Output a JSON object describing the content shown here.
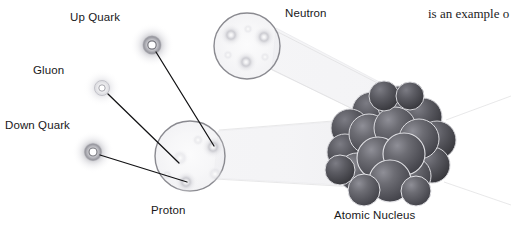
{
  "figure": {
    "kind": "scientific-illustration",
    "background_color": "#ffffff",
    "label_color": "#18181a",
    "leader_line_color": "#121214",
    "cone_color": "#e2e2e4",
    "nucleus_sphere_color": "#5d5d63",
    "labels": {
      "up_quark": "Up Quark",
      "gluon": "Gluon",
      "down_quark": "Down Quark",
      "proton": "Proton",
      "neutron": "Neutron",
      "atomic_nucleus": "Atomic Nucleus"
    },
    "body_text": "is an example o",
    "structures": {
      "proton": {
        "name": "Proton",
        "center_x": 190,
        "center_y": 156,
        "radius": 35,
        "quark_count": 3
      },
      "neutron": {
        "name": "Neutron",
        "center_x": 247,
        "center_y": 46,
        "radius": 33,
        "quark_count": 3
      },
      "nucleus": {
        "name": "Atomic Nucleus",
        "center_x": 392,
        "center_y": 152,
        "radius": 55,
        "nucleon_count": 21
      }
    },
    "callouts": [
      {
        "label": "Up Quark",
        "particle_x": 152,
        "particle_y": 45,
        "target_x": 214,
        "target_y": 146
      },
      {
        "label": "Gluon",
        "particle_x": 102,
        "particle_y": 88,
        "target_x": 178,
        "target_y": 163
      },
      {
        "label": "Down Quark",
        "particle_x": 93,
        "particle_y": 152,
        "target_x": 187,
        "target_y": 182
      }
    ]
  }
}
